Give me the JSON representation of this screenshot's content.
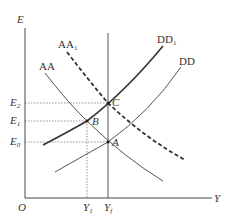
{
  "diagram": {
    "axes": {
      "y_label": "E",
      "x_label": "Y",
      "origin_label": "O"
    },
    "curves": [
      {
        "name": "AA",
        "label": "AA",
        "style": "solid-thin"
      },
      {
        "name": "AA1",
        "label": "AA",
        "label_sub": "1",
        "style": "dashed-thick"
      },
      {
        "name": "DD",
        "label": "DD",
        "style": "solid-thin"
      },
      {
        "name": "DD1",
        "label": "DD",
        "label_sub": "1",
        "style": "solid-thick"
      }
    ],
    "points": [
      {
        "name": "A",
        "label": "A"
      },
      {
        "name": "B",
        "label": "B"
      },
      {
        "name": "C",
        "label": "C"
      }
    ],
    "y_ticks": [
      {
        "label": "E",
        "sub": "2"
      },
      {
        "label": "E",
        "sub": "1"
      },
      {
        "label": "E",
        "sub": "0"
      }
    ],
    "x_ticks": [
      {
        "label": "Y",
        "sub": "1"
      },
      {
        "label": "Y",
        "sub": "f"
      }
    ],
    "colors": {
      "line": "#333333",
      "guide": "#666666",
      "background": "#ffffff"
    }
  }
}
